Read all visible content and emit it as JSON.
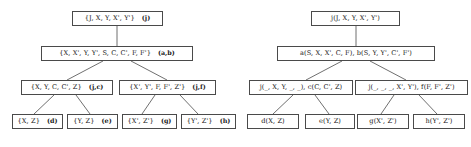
{
  "figure": {
    "background_color": "#ffffff",
    "border_color": "#4a4a4a",
    "text_color": "#1a1a1a"
  },
  "left_tree": {
    "name": "join-tree-sets",
    "nodes": {
      "root": {
        "label": "{J, X, Y, X', Y'}",
        "tag": "(j)"
      },
      "level2": {
        "label": "{X, X', Y, Y', S, C, C', F, F'}",
        "tag": "(a,b)"
      },
      "level3_left": {
        "label": "{X, Y, C, C', Z}",
        "tag": "(j,c)"
      },
      "level3_right": {
        "label": "{X', Y', F, F', Z'}",
        "tag": "(j,f)"
      },
      "leaf1": {
        "label": "{X, Z}",
        "tag": "(d)"
      },
      "leaf2": {
        "label": "{Y, Z}",
        "tag": "(e)"
      },
      "leaf3": {
        "label": "{X', Z'}",
        "tag": "(g)"
      },
      "leaf4": {
        "label": "{Y', Z'}",
        "tag": "(h)"
      }
    }
  },
  "right_tree": {
    "name": "join-tree-atoms",
    "nodes": {
      "root": {
        "label": "j(J, X, Y, X', Y')",
        "tag": ""
      },
      "level2": {
        "label": "a(S, X, X', C, F),  b(S, Y, Y', C', F')",
        "tag": ""
      },
      "level3_left": {
        "label": "j(_, X, Y, _, _),  c(C, C', Z)",
        "tag": ""
      },
      "level3_right": {
        "label": "j(_, _, _, X', Y'),  f(F, F', Z')",
        "tag": ""
      },
      "leaf1": {
        "label": "d(X, Z)",
        "tag": ""
      },
      "leaf2": {
        "label": "e(Y, Z)",
        "tag": ""
      },
      "leaf3": {
        "label": "g(X', Z')",
        "tag": ""
      },
      "leaf4": {
        "label": "h(Y', Z')",
        "tag": ""
      }
    }
  }
}
